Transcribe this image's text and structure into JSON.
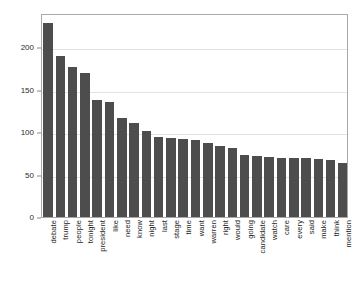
{
  "chart_data": {
    "type": "bar",
    "title": "",
    "subtitle": "",
    "xlabel": "",
    "ylabel": "",
    "ylim": [
      0,
      240
    ],
    "grid": true,
    "legend": null,
    "orientation": "vertical",
    "bar_color": "#4d4d4d",
    "categories": [
      "debate",
      "trump",
      "people",
      "tonight",
      "president",
      "like",
      "need",
      "know",
      "night",
      "last",
      "stage",
      "time",
      "want",
      "warren",
      "right",
      "would",
      "going",
      "candidate",
      "watch",
      "care",
      "every",
      "said",
      "make",
      "think",
      "mention"
    ],
    "values": [
      228,
      190,
      177,
      170,
      138,
      135,
      117,
      111,
      101,
      94,
      93,
      92,
      91,
      87,
      83,
      81,
      73,
      72,
      71,
      70,
      70,
      70,
      68,
      67,
      64
    ],
    "y_ticks": [
      0,
      50,
      100,
      150,
      200
    ],
    "y_tick_labels": [
      "0",
      "50",
      "100",
      "150",
      "200"
    ],
    "x_tick_rotation": -90
  },
  "figure": {
    "background_color": "#ffffff",
    "plot_border_color": "#a8a8a8",
    "gridline_color": "#e2e2e2"
  }
}
